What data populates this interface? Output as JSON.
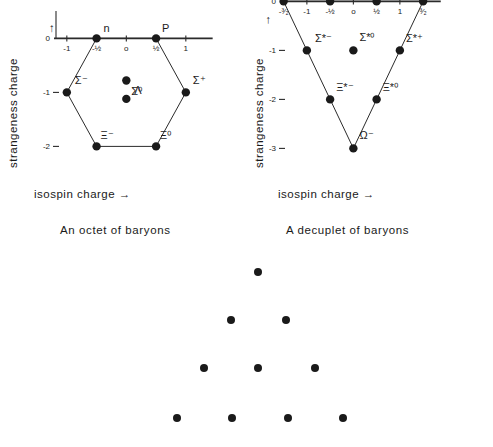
{
  "figure": {
    "octet": {
      "caption": "An octet of baryons",
      "axes": {
        "xlabel": "isospin charge",
        "xlabel_arrow": "→",
        "ylabel": "strangeness charge",
        "ylabel_arrow": "↑",
        "xticks": [
          "-1",
          "-½",
          "o",
          "½",
          "1"
        ],
        "xtick_values": [
          -1,
          -0.5,
          0,
          0.5,
          1
        ],
        "yticks": [
          "-2",
          "-1",
          "0"
        ],
        "ytick_values": [
          -2,
          -1,
          0
        ],
        "xlim": [
          -1.35,
          1.35
        ],
        "ylim": [
          -2.4,
          0.25
        ]
      },
      "shape": "hexagon",
      "particles": [
        {
          "label": "Ξ⁻",
          "name": "xi-minus",
          "x": -0.5,
          "y": -2,
          "label_dx": 4,
          "label_dy": -7
        },
        {
          "label": "Ξ⁰",
          "name": "xi-zero",
          "x": 0.5,
          "y": -2,
          "label_dx": 4,
          "label_dy": -7
        },
        {
          "label": "Σ⁻",
          "name": "sigma-minus",
          "x": -1,
          "y": -1,
          "label_dx": 8,
          "label_dy": -8
        },
        {
          "label": "Σ⁺",
          "name": "sigma-plus",
          "x": 1,
          "y": -1,
          "label_dx": 7,
          "label_dy": -8
        },
        {
          "label": "Λ",
          "name": "lambda",
          "x": 0,
          "y": -1.12,
          "label_dx": 8,
          "label_dy": -5
        },
        {
          "label": "Σ⁰",
          "name": "sigma-zero",
          "x": 0,
          "y": -0.78,
          "label_dx": 5,
          "label_dy": 14
        },
        {
          "label": "n",
          "name": "neutron",
          "x": -0.5,
          "y": 0,
          "label_dx": 7,
          "label_dy": -6
        },
        {
          "label": "P",
          "name": "proton",
          "x": 0.5,
          "y": 0,
          "label_dx": 6,
          "label_dy": -6
        }
      ],
      "outline_vertices": [
        {
          "x": -0.5,
          "y": 0
        },
        {
          "x": -1,
          "y": -1
        },
        {
          "x": -0.5,
          "y": -2
        },
        {
          "x": 0.5,
          "y": -2
        },
        {
          "x": 1,
          "y": -1
        },
        {
          "x": 0.5,
          "y": 0
        }
      ]
    },
    "decuplet": {
      "caption": "A decuplet of baryons",
      "axes": {
        "xlabel": "isospin charge",
        "xlabel_arrow": "→",
        "ylabel": "strangeness charge",
        "ylabel_arrow": "→",
        "xticks": [
          "-³⁄₂",
          "-1",
          "-½",
          "o",
          "½",
          "1",
          "³⁄₂"
        ],
        "xtick_values": [
          -1.5,
          -1,
          -0.5,
          0,
          0.5,
          1,
          1.5
        ],
        "yticks": [
          "-3",
          "-2",
          "-1",
          "0"
        ],
        "ytick_values": [
          -3,
          -2,
          -1,
          0
        ],
        "xlim": [
          -1.75,
          1.75
        ],
        "ylim": [
          -3.4,
          0.25
        ]
      },
      "shape": "triangle",
      "particles": [
        {
          "label": "Ω⁻",
          "name": "omega-minus",
          "x": 0,
          "y": -3,
          "label_dx": 6,
          "label_dy": -9
        },
        {
          "label": "Ξ*⁻",
          "name": "xi-star-minus",
          "x": -0.5,
          "y": -2,
          "label_dx": 6,
          "label_dy": -8
        },
        {
          "label": "Ξ*⁰",
          "name": "xi-star-zero",
          "x": 0.5,
          "y": -2,
          "label_dx": 6,
          "label_dy": -8
        },
        {
          "label": "Σ*⁻",
          "name": "sigma-star-minus",
          "x": -1,
          "y": -1,
          "label_dx": 8,
          "label_dy": -8
        },
        {
          "label": "Σ*⁰",
          "name": "sigma-star-zero",
          "x": 0,
          "y": -1,
          "label_dx": 6,
          "label_dy": -9
        },
        {
          "label": "Σ*⁺",
          "name": "sigma-star-plus",
          "x": 1,
          "y": -1,
          "label_dx": 6,
          "label_dy": -8
        },
        {
          "label": "N*⁻",
          "name": "n-star-minus",
          "x": -1.5,
          "y": 0,
          "label_dx": 7,
          "label_dy": -6
        },
        {
          "label": "N*⁰",
          "name": "n-star-zero",
          "x": -0.5,
          "y": 0,
          "label_dx": 6,
          "label_dy": -6
        },
        {
          "label": "N*⁺",
          "name": "n-star-plus",
          "x": 0.5,
          "y": 0,
          "label_dx": 6,
          "label_dy": -6
        },
        {
          "label": "N*⁺⁺",
          "name": "n-star-plusplus",
          "x": 1.5,
          "y": 0,
          "label_dx": 6,
          "label_dy": -6
        }
      ],
      "outline_vertices": [
        {
          "x": -1.5,
          "y": 0
        },
        {
          "x": 0,
          "y": -3
        },
        {
          "x": 1.5,
          "y": 0
        }
      ]
    },
    "dot_pattern": {
      "description": "triangular array of ten dots",
      "rows": [
        {
          "row_index": 0,
          "count": 1,
          "dots": [
            {
              "x": 258,
              "y": 272
            }
          ]
        },
        {
          "row_index": 1,
          "count": 2,
          "dots": [
            {
              "x": 231,
              "y": 320
            },
            {
              "x": 286,
              "y": 320
            }
          ]
        },
        {
          "row_index": 2,
          "count": 3,
          "dots": [
            {
              "x": 204,
              "y": 368
            },
            {
              "x": 258,
              "y": 368
            },
            {
              "x": 315,
              "y": 368
            }
          ]
        },
        {
          "row_index": 3,
          "count": 4,
          "dots": [
            {
              "x": 177,
              "y": 418
            },
            {
              "x": 232,
              "y": 418
            },
            {
              "x": 288,
              "y": 418
            },
            {
              "x": 343,
              "y": 418
            }
          ]
        }
      ]
    }
  },
  "style": {
    "ink": "#1a1a1a",
    "line": "#2b2b2b",
    "background": "#ffffff",
    "dot_radius": 4.2,
    "small_dot_radius": 4.0
  },
  "chart_data": {
    "type": "scatter",
    "title": "",
    "charts": [
      {
        "title": "An octet of baryons",
        "type": "scatter",
        "xlabel": "isospin charge",
        "ylabel": "strangeness charge",
        "xlim": [
          -1.35,
          1.35
        ],
        "ylim": [
          -2.4,
          0.25
        ],
        "xticks": [
          -1,
          -0.5,
          0,
          0.5,
          1
        ],
        "xticklabels": [
          "-1",
          "-½",
          "o",
          "½",
          "1"
        ],
        "yticks": [
          -2,
          -1,
          0
        ],
        "yticklabels": [
          "-2",
          "-1",
          "0"
        ],
        "grid": false,
        "legend": "none",
        "points": [
          {
            "label": "Ξ⁻",
            "x": -0.5,
            "y": -2
          },
          {
            "label": "Ξ⁰",
            "x": 0.5,
            "y": -2
          },
          {
            "label": "Σ⁻",
            "x": -1,
            "y": -1
          },
          {
            "label": "Σ⁺",
            "x": 1,
            "y": -1
          },
          {
            "label": "Λ",
            "x": 0,
            "y": -1
          },
          {
            "label": "Σ⁰",
            "x": 0,
            "y": -1
          },
          {
            "label": "n",
            "x": -0.5,
            "y": 0
          },
          {
            "label": "P",
            "x": 0.5,
            "y": 0
          }
        ]
      },
      {
        "title": "A decuplet of baryons",
        "type": "scatter",
        "xlabel": "isospin charge",
        "ylabel": "strangeness charge",
        "xlim": [
          -1.75,
          1.75
        ],
        "ylim": [
          -3.4,
          0.25
        ],
        "xticks": [
          -1.5,
          -1,
          -0.5,
          0,
          0.5,
          1,
          1.5
        ],
        "xticklabels": [
          "-³⁄₂",
          "-1",
          "-½",
          "o",
          "½",
          "1",
          "³⁄₂"
        ],
        "yticks": [
          -3,
          -2,
          -1,
          0
        ],
        "yticklabels": [
          "-3",
          "-2",
          "-1",
          "0"
        ],
        "grid": false,
        "legend": "none",
        "points": [
          {
            "label": "Ω⁻",
            "x": 0,
            "y": -3
          },
          {
            "label": "Ξ*⁻",
            "x": -0.5,
            "y": -2
          },
          {
            "label": "Ξ*⁰",
            "x": 0.5,
            "y": -2
          },
          {
            "label": "Σ*⁻",
            "x": -1,
            "y": -1
          },
          {
            "label": "Σ*⁰",
            "x": 0,
            "y": -1
          },
          {
            "label": "Σ*⁺",
            "x": 1,
            "y": -1
          },
          {
            "label": "N*⁻",
            "x": -1.5,
            "y": 0
          },
          {
            "label": "N*⁰",
            "x": -0.5,
            "y": 0
          },
          {
            "label": "N*⁺",
            "x": 0.5,
            "y": 0
          },
          {
            "label": "N*⁺⁺",
            "x": 1.5,
            "y": 0
          }
        ]
      }
    ]
  }
}
